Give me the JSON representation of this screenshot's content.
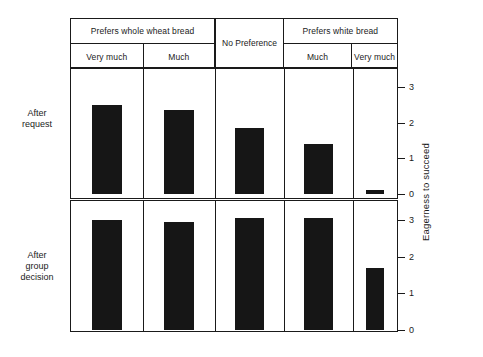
{
  "chart_data": {
    "type": "bar",
    "title": "",
    "subtitle": "",
    "xlabel": "",
    "ylabel": "Eagerness to succeed",
    "ylim": [
      0,
      3
    ],
    "yticks": [
      0,
      1,
      2,
      3
    ],
    "grid": false,
    "legend_position": "none",
    "layout": "2 stacked panels sharing 5 categorical columns",
    "column_groups": [
      {
        "label": "Prefers whole wheat bread",
        "span": 2
      },
      {
        "label": "No Preference",
        "span": 1,
        "spans_both_header_rows": true
      },
      {
        "label": "Prefers white bread",
        "span": 2
      }
    ],
    "categories": [
      "Very much",
      "Much",
      "",
      "Much",
      "Very much"
    ],
    "panels": [
      {
        "row_label": "After request",
        "values": [
          2.5,
          2.35,
          1.85,
          1.4,
          0.1
        ]
      },
      {
        "row_label": "After group decision",
        "values": [
          3.0,
          2.95,
          3.05,
          3.05,
          1.7
        ]
      }
    ],
    "bar_color": "#161616"
  },
  "header": {
    "groups": [
      {
        "label": "Prefers whole wheat bread"
      },
      {
        "label": "No Preference"
      },
      {
        "label": "Prefers white bread"
      }
    ],
    "subs": [
      {
        "label": "Very much"
      },
      {
        "label": "Much"
      },
      {
        "label": "Much"
      },
      {
        "label": "Very much"
      }
    ]
  },
  "rows": [
    {
      "label": "After\nrequest",
      "line1": "After",
      "line2": "request"
    },
    {
      "label": "After\ngroup\ndecision",
      "line1": "After",
      "line2": "group",
      "line3": "decision"
    }
  ],
  "axis": {
    "title": "Eagerness to succeed",
    "ticks_top": [
      "3",
      "2",
      "1",
      "0"
    ],
    "ticks_bottom": [
      "3",
      "2",
      "1",
      "0"
    ]
  }
}
